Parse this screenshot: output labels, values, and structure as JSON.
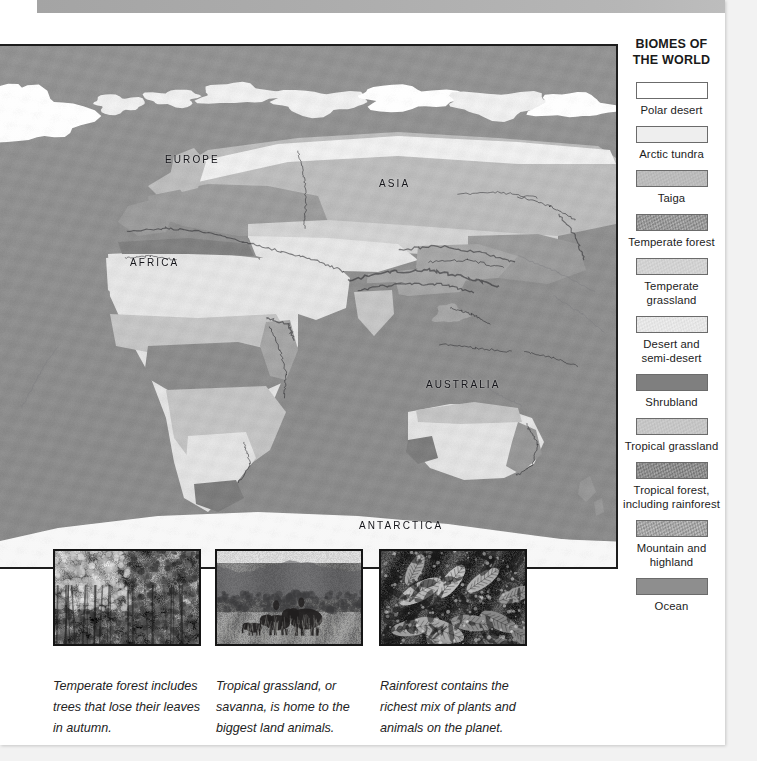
{
  "page": {
    "background_color": "#ffffff",
    "outer_background_color": "#f2f2f2",
    "top_bar_color": "#adadad"
  },
  "map": {
    "frame_border_color": "#1d1d1d",
    "ocean_color": "#8e8e8e",
    "labels": [
      {
        "name": "europe",
        "text": "EUROPE",
        "x": 163,
        "y": 152
      },
      {
        "name": "asia",
        "text": "ASIA",
        "x": 377,
        "y": 176
      },
      {
        "name": "africa",
        "text": "AFRICA",
        "x": 128,
        "y": 255
      },
      {
        "name": "australia",
        "text": "AUSTRALIA",
        "x": 424,
        "y": 377
      },
      {
        "name": "antarctica",
        "text": "ANTARCTICA",
        "x": 357,
        "y": 518
      }
    ]
  },
  "legend": {
    "title_line1": "BIOMES OF",
    "title_line2": "THE WORLD",
    "items": [
      {
        "id": "polar-desert",
        "label": "Polar desert",
        "color": "#ffffff"
      },
      {
        "id": "arctic-tundra",
        "label": "Arctic tundra",
        "color": "#eeeeee"
      },
      {
        "id": "taiga",
        "label": "Taiga",
        "color": "#bbbbbb"
      },
      {
        "id": "temperate-forest",
        "label": "Temperate forest",
        "color": "#9a9a9a"
      },
      {
        "id": "temperate-grassland",
        "label": "Temperate grassland",
        "color": "#d2d2d2"
      },
      {
        "id": "desert-semi-desert",
        "label": "Desert and\nsemi-desert",
        "color": "#e6e6e6"
      },
      {
        "id": "shrubland",
        "label": "Shrubland",
        "color": "#7f7f7f"
      },
      {
        "id": "tropical-grassland",
        "label": "Tropical grassland",
        "color": "#c6c6c6"
      },
      {
        "id": "tropical-forest",
        "label": "Tropical forest,\nincluding rainforest",
        "color": "#8d8d8d"
      },
      {
        "id": "mountain-highland",
        "label": "Mountain and\nhighland",
        "color": "#a6a6a6"
      },
      {
        "id": "ocean",
        "label": "Ocean",
        "color": "#8e8e8e"
      }
    ]
  },
  "photos": [
    {
      "id": "temperate-forest-photo",
      "alt": "Temperate forest",
      "caption": "Temperate forest includes trees that lose their leaves in autumn."
    },
    {
      "id": "tropical-grassland-photo",
      "alt": "Tropical grassland savanna with elephants",
      "caption": "Tropical grassland, or savanna, is home to the biggest land animals."
    },
    {
      "id": "rainforest-photo",
      "alt": "Rainforest foliage",
      "caption": "Rainforest contains the richest mix of plants and animals on the planet."
    }
  ]
}
